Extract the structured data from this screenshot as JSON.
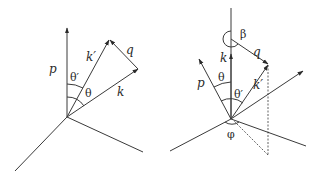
{
  "figure": {
    "left_diagram": {
      "labels": {
        "p": "p",
        "k_prime": "k′",
        "q": "q",
        "k": "k",
        "theta": "θ",
        "theta_prime": "θ′"
      }
    },
    "right_diagram": {
      "labels": {
        "p": "p",
        "k": "k",
        "k_prime": "k′",
        "q": "q",
        "beta": "β",
        "theta": "θ",
        "theta_prime": "θ′",
        "phi": "φ"
      }
    },
    "colors": {
      "line": "#3a3a3a",
      "background": "#ffffff"
    }
  }
}
